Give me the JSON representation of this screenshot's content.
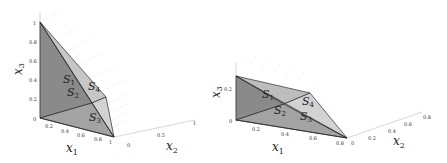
{
  "figure": {
    "left_plot": {
      "axes": {
        "x1": {
          "label": "x",
          "sub": "1",
          "ticks": [
            "0",
            "0.2",
            "0.4",
            "0.6",
            "0.8",
            "1"
          ]
        },
        "x2": {
          "label": "x",
          "sub": "2",
          "ticks": [
            "0",
            "0.5",
            "1"
          ]
        },
        "x3": {
          "label": "x",
          "sub": "3",
          "ticks": [
            "0",
            "0.2",
            "0.4",
            "0.6",
            "0.8",
            "1"
          ]
        }
      },
      "regions": [
        {
          "label": "S",
          "sub": "1"
        },
        {
          "label": "S",
          "sub": "2"
        },
        {
          "label": "S",
          "sub": "3"
        },
        {
          "label": "S",
          "sub": "4"
        }
      ]
    },
    "right_plot": {
      "axes": {
        "x1": {
          "label": "x",
          "sub": "1",
          "ticks": [
            "0",
            "0.2",
            "0.4",
            "0.6",
            "0.8"
          ]
        },
        "x2": {
          "label": "x",
          "sub": "2",
          "ticks": [
            "0",
            "0.2",
            "0.4",
            "0.6",
            "0.8"
          ]
        },
        "x3": {
          "label": "x",
          "sub": "3",
          "ticks": [
            "0",
            "0.2"
          ]
        }
      },
      "regions": [
        {
          "label": "S",
          "sub": "1"
        },
        {
          "label": "S",
          "sub": "2"
        },
        {
          "label": "S",
          "sub": "3"
        },
        {
          "label": "S",
          "sub": "4"
        }
      ]
    },
    "colors": {
      "face_dark": "#8a8a8a",
      "face_mid": "#a6a6a6",
      "face_light": "#cfcfcf",
      "edge": "#2a2a2a",
      "grid": "#d8d8d8"
    }
  }
}
